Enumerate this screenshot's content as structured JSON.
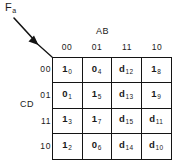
{
  "figure": {
    "type": "karnaugh-map",
    "function_label": {
      "base": "F",
      "subscript": "a"
    },
    "column_group_label": "AB",
    "row_group_label": "CD",
    "column_headers": [
      "00",
      "01",
      "11",
      "10"
    ],
    "row_headers": [
      "00",
      "01",
      "11",
      "10"
    ],
    "colors": {
      "ink": "#141414",
      "background": "#ffffff"
    },
    "cells": [
      [
        {
          "value": "1",
          "index": "0"
        },
        {
          "value": "0",
          "index": "4"
        },
        {
          "value": "d",
          "index": "12"
        },
        {
          "value": "1",
          "index": "8"
        }
      ],
      [
        {
          "value": "0",
          "index": "1"
        },
        {
          "value": "1",
          "index": "5"
        },
        {
          "value": "d",
          "index": "13"
        },
        {
          "value": "1",
          "index": "9"
        }
      ],
      [
        {
          "value": "1",
          "index": "3"
        },
        {
          "value": "1",
          "index": "7"
        },
        {
          "value": "d",
          "index": "15"
        },
        {
          "value": "d",
          "index": "11"
        }
      ],
      [
        {
          "value": "1",
          "index": "2"
        },
        {
          "value": "0",
          "index": "6"
        },
        {
          "value": "d",
          "index": "14"
        },
        {
          "value": "d",
          "index": "10"
        }
      ]
    ]
  }
}
